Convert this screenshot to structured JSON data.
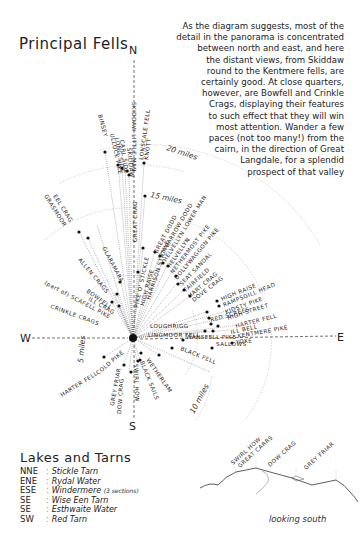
{
  "title": "Principal Fells",
  "intro": {
    "lines": [
      "As the diagram suggests, most of the",
      "detail in the panorama is concentrated",
      "between north and east, and here",
      "the distant views, from Skiddaw",
      "round to the Kentmere fells, are",
      "certainly good.  At close quarters,",
      "however, are Bowfell and Crinkle",
      "Crags, displaying their features",
      "to such effect that they will win",
      "most attention.   Wander a few",
      "paces (not too many!) from the",
      "cairn, in the direction of Great",
      "Langdale, for a splendid",
      "prospect of that valley"
    ]
  },
  "compass": {
    "north": "N",
    "south": "S",
    "east": "E",
    "west": "W"
  },
  "rings": {
    "r5": "5 miles",
    "r10": "10 miles",
    "r15": "15 miles",
    "r20": "20 miles"
  },
  "fells": {
    "skiddaw": "SKIDDAW",
    "little_man": "LITTLE MAN",
    "skiddaw_combined": "SKIDDAW   LITTLE MAN",
    "skiddaw_group": "SKIDDAW LITTLE MAN",
    "binsey": "BINSEY",
    "ullock_pike": "ULLOCK PIKE",
    "long_side": "LONG SIDE",
    "carl_side": "CARL SIDE",
    "sale_how": "SKIDDAW",
    "lonscale_fell": "LONSCALE FELL",
    "knott": "KNOTT",
    "great_crag": "GREAT CRAG",
    "eel_crag": "EEL CRAG",
    "grasmoor": "GRASMOOR",
    "great_dodd": "GREAT DODD",
    "stybarrow_dodd": "STYBARROW DODD",
    "helvellyn_lower_man": "HELVELLYN LOWER MAN",
    "helvellyn": "HELVELLYN",
    "nethermost_pike": "NETHERMOST PIKE",
    "dollywaggon_pike": "DOLLYWAGGON PIKE",
    "seat_sandal": "SEAT SANDAL",
    "fairfield": "FAIRFIELD",
    "hart_crag": "HART CRAG",
    "dove_crag": "DOVE CRAG",
    "red_screes": "RED SCREES",
    "high_raise_e": "HIGH RAISE",
    "rampsgill_head": "RAMPSGILL HEAD",
    "kidsty_pike": "KIDSTY PIKE",
    "high_street": "HIGH STREET",
    "harter_fell_e": "HARTER FELL",
    "ill_bell": "ILL BELL",
    "kentmere_pike": "KENTMERE PIKE",
    "yoke": "YOKE",
    "loughrigg": "LOUGHRIGG",
    "lingmoor_fell": "LINGMOOR FELL",
    "wansfell_pike": "WANSFELL PIKE",
    "sallows": "SALLOWS",
    "black_fell": "BLACK FELL",
    "wetherlam": "WETHERLAM",
    "black_sails": "BLACK SAILS",
    "swirl_how": "SWIRL HOW",
    "dow_crag": "DOW CRAG",
    "grey_friar": "GREY FRIAR",
    "cold_pike": "COLD PIKE",
    "harter_fell_w": "HARTER FELL",
    "crinkle_crags": "CRINKLE CRAGS",
    "scafell_pike": "(part of) SCAFELL PIKE",
    "ill_crag": "ILL CRAG",
    "bowfell": "BOWFELL",
    "allen_crags": "ALLEN CRAGS",
    "glaramara": "GLARAMARA",
    "pike_o_stickle": "PIKE O' STICKLE",
    "high_raise": "HIGH RAISE",
    "harrison_stickle": "HARRISON STICKLE",
    "sergeant_man": "SKIDDAW LITTLE MAN"
  },
  "lakes": {
    "heading": "Lakes and Tarns",
    "items": [
      {
        "dir": "NNE",
        "name": "Stickle Tarn",
        "note": ""
      },
      {
        "dir": "ENE",
        "name": "Rydal Water",
        "note": ""
      },
      {
        "dir": "ESE",
        "name": "Windermere",
        "note": "(3 sections)"
      },
      {
        "dir": "SE",
        "name": "Wise Een Tarn",
        "note": ""
      },
      {
        "dir": "SE",
        "name": "Esthwaite Water",
        "note": ""
      },
      {
        "dir": "SW",
        "name": "Red Tarn",
        "note": ""
      }
    ]
  },
  "profile": {
    "labels": [
      "SWIRL HOW",
      "GREAT CARRS",
      "DOW CRAG",
      "GREY FRIAR"
    ],
    "caption": "looking south"
  }
}
